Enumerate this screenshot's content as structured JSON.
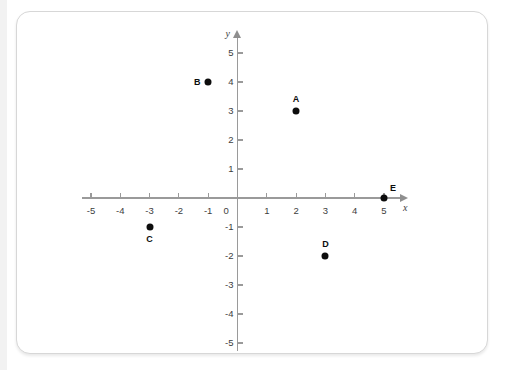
{
  "card": {
    "background_color": "#ffffff",
    "border_color": "#d7d7d7"
  },
  "watermark": {
    "text": "",
    "visible": false
  },
  "chart_data": {
    "type": "scatter",
    "title": "",
    "xlabel": "x",
    "ylabel": "y",
    "xlim": [
      -5,
      5
    ],
    "ylim": [
      -5,
      5
    ],
    "grid": false,
    "legend": "none",
    "axis_color": "#9a9a9a",
    "point_color": "#0d0d0d",
    "x_ticks": [
      -5,
      -4,
      -3,
      -2,
      -1,
      0,
      1,
      2,
      3,
      4,
      5
    ],
    "x_tick_labels": [
      "-5",
      "-4",
      "-3",
      "-2",
      "-1",
      "0",
      "1",
      "2",
      "3",
      "4",
      "5"
    ],
    "y_ticks": [
      -5,
      -4,
      -3,
      -2,
      -1,
      1,
      2,
      3,
      4,
      5
    ],
    "y_tick_labels": [
      "-5",
      "-4",
      "-3",
      "-2",
      "-1",
      "1",
      "2",
      "3",
      "4",
      "5"
    ],
    "origin_label": "0",
    "points": [
      {
        "label": "A",
        "x": 2,
        "y": 3,
        "label_position": "above"
      },
      {
        "label": "B",
        "x": -1,
        "y": 4,
        "label_position": "left"
      },
      {
        "label": "C",
        "x": -3,
        "y": -1,
        "label_position": "below"
      },
      {
        "label": "D",
        "x": 3,
        "y": -2,
        "label_position": "above"
      },
      {
        "label": "E",
        "x": 5,
        "y": 0,
        "label_position": "above-right"
      }
    ]
  }
}
